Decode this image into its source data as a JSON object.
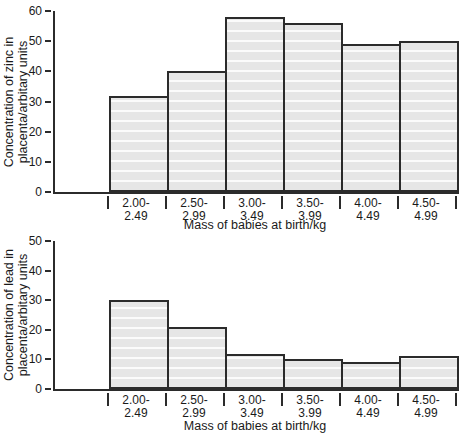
{
  "page": {
    "background": "#ffffff",
    "text_color": "#1a1a1a",
    "line_color": "#2b2b2b",
    "bar_fill": "#e6e6e6",
    "bar_stripe": "#fbfbfb"
  },
  "chart_data": [
    {
      "type": "bar",
      "title": "",
      "ylabel": "Concentration of zinc in\nplacenta/arbitary units",
      "xlabel": "Mass of babies at birth/kg",
      "categories": [
        "2.00-2.49",
        "2.50-2.99",
        "3.00-3.49",
        "3.50-3.99",
        "4.00-4.49",
        "4.50-4.99"
      ],
      "values": [
        32,
        40,
        58,
        56,
        49,
        50
      ],
      "ylim": [
        0,
        60
      ],
      "yticks": [
        0,
        10,
        20,
        30,
        40,
        50,
        60
      ],
      "grid": false,
      "legend": false
    },
    {
      "type": "bar",
      "title": "",
      "ylabel": "Concentration of lead in\nplacenta/arbitary units",
      "xlabel": "Mass of babies at birth/kg",
      "categories": [
        "2.00-2.49",
        "2.50-2.99",
        "3.00-3.49",
        "3.50-3.99",
        "4.00-4.49",
        "4.50-4.99"
      ],
      "values": [
        30,
        21,
        12,
        10,
        9,
        11
      ],
      "ylim": [
        0,
        50
      ],
      "yticks": [
        0,
        10,
        20,
        30,
        40,
        50
      ],
      "grid": false,
      "legend": false
    }
  ]
}
